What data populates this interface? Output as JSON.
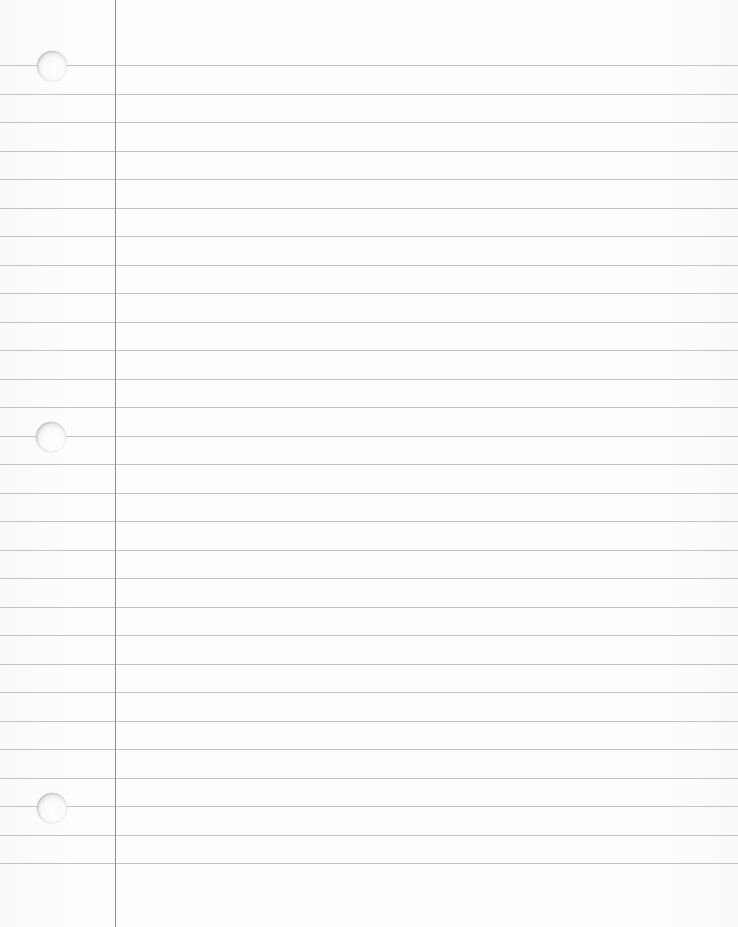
{
  "paper": {
    "type": "ruled-notebook-paper",
    "width": 738,
    "height": 927,
    "background_color": "#fdfdfd",
    "rule_color": "#b9b9b9",
    "margin_color": "#8e8e8e",
    "margin_x": 115,
    "rules_first_y": 65,
    "rule_spacing": 28.5,
    "rule_count": 29,
    "holes": [
      {
        "x": 52,
        "y": 66,
        "diameter": 30
      },
      {
        "x": 51,
        "y": 437,
        "diameter": 30
      },
      {
        "x": 52,
        "y": 808,
        "diameter": 30
      }
    ]
  }
}
